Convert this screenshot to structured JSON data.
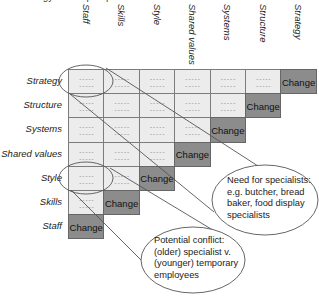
{
  "caption": "Strategy-driven perspective",
  "columns": [
    "Staff",
    "Skills",
    "Style",
    "Shared values",
    "Systems",
    "Structure",
    "Strategy"
  ],
  "rows": [
    "Strategy",
    "Structure",
    "Systems",
    "Shared values",
    "Style",
    "Skills",
    "Staff"
  ],
  "placeholder": "-----",
  "change_label": "Change",
  "colors": {
    "cell_fill": "#ececec",
    "change_fill": "#8c8c8c",
    "border": "#7c7c7c"
  },
  "callouts": [
    {
      "id": "specialists",
      "lines": [
        "Need for specialists:",
        "e.g. butcher, bread",
        "baker, food display",
        "specialists"
      ],
      "highlight_cell": {
        "row": "Strategy",
        "column": "Staff"
      }
    },
    {
      "id": "conflict",
      "lines": [
        "Potential conflict:",
        "(older) specialist v.",
        "(younger) temporary",
        "employees"
      ],
      "highlight_cell": {
        "row": "Style",
        "column": "Staff"
      }
    }
  ]
}
